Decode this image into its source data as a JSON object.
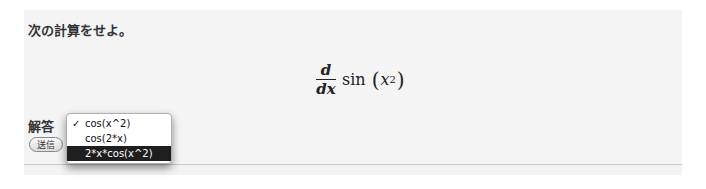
{
  "question": {
    "prompt": "次の計算をせよ。",
    "formula": {
      "numerator": "d",
      "denominator": "dx",
      "function": "sin",
      "open_paren": "(",
      "variable": "x",
      "exponent": "2",
      "close_paren": ")"
    }
  },
  "answer": {
    "label": "解答",
    "dropdown": {
      "options": [
        {
          "label": "cos(x^2)",
          "checked": true,
          "highlighted": false
        },
        {
          "label": "cos(2*x)",
          "checked": false,
          "highlighted": false
        },
        {
          "label": "2*x*cos(x^2)",
          "checked": false,
          "highlighted": true
        }
      ],
      "check_glyph": "✓"
    },
    "submit_label": "送信"
  },
  "colors": {
    "panel_background": "#f4f4f4",
    "highlight_background": "#1e1e1e",
    "highlight_text": "#ffffff"
  }
}
